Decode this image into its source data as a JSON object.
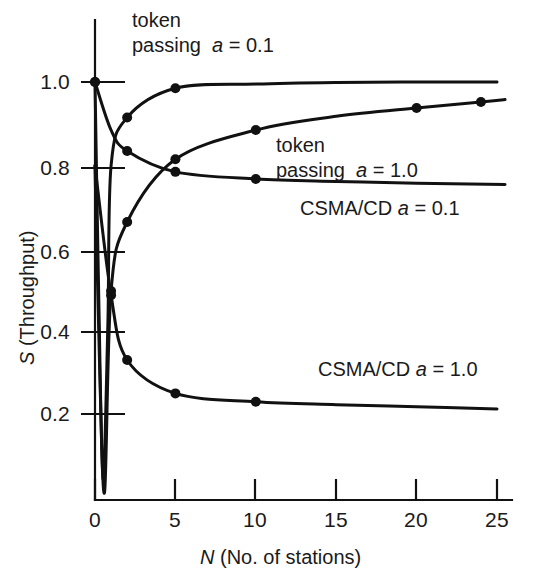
{
  "chart_data": {
    "type": "line",
    "title": "",
    "xlabel": "N (No. of stations)",
    "ylabel": "S (Throughput)",
    "xlim": [
      0,
      26
    ],
    "ylim": [
      0,
      1.06
    ],
    "grid": false,
    "legend_position": "inline-annotations",
    "xticks": [
      0,
      5,
      10,
      15,
      20,
      25
    ],
    "xtick_labels": [
      "0",
      "5",
      "10",
      "15",
      "20",
      "25"
    ],
    "yticks": [
      0.2,
      0.4,
      0.6,
      0.8,
      1.0
    ],
    "ytick_labels": [
      "0.2",
      "0.4",
      "0.6",
      "0.8",
      "1.0"
    ],
    "series": [
      {
        "name": "token passing a = 0.1",
        "label_html": "token<br>passing &nbsp;<i>a</i> = 0.1",
        "x": [
          0.0,
          0.25,
          0.5,
          0.8,
          1.0,
          2.0,
          5.0,
          10.0,
          15.0,
          20.0,
          25.0
        ],
        "y": [
          1.0,
          0.45,
          0.05,
          0.42,
          0.8,
          0.915,
          0.985,
          0.995,
          0.999,
          1.0,
          1.0
        ],
        "markers_x": [
          0,
          2,
          5
        ],
        "markers_y": [
          1.0,
          0.915,
          0.985
        ]
      },
      {
        "name": "token passing a = 1.0",
        "label_html": "token<br>passing &nbsp;<i>a</i> = 1.0",
        "x": [
          0.0,
          0.3,
          0.6,
          1.0,
          2.0,
          5.0,
          10.0,
          15.0,
          20.0,
          24.0,
          25.5
        ],
        "y": [
          0.8,
          0.3,
          0.02,
          0.5,
          0.665,
          0.815,
          0.885,
          0.918,
          0.938,
          0.952,
          0.958
        ],
        "markers_x": [
          1.0,
          2.0,
          5.0,
          10.0,
          20.0,
          24.0
        ],
        "markers_y": [
          0.5,
          0.665,
          0.815,
          0.885,
          0.938,
          0.952
        ]
      },
      {
        "name": "CSMA/CD a = 0.1",
        "label_html": "CSMA/CD <i>a</i> = 0.1",
        "x": [
          0.0,
          1.0,
          2.0,
          5.0,
          10.0,
          15.0,
          20.0,
          25.5
        ],
        "y": [
          1.0,
          0.885,
          0.835,
          0.785,
          0.768,
          0.762,
          0.758,
          0.755
        ],
        "markers_x": [
          0.0,
          2.0,
          5.0,
          10.0
        ],
        "markers_y": [
          1.0,
          0.835,
          0.785,
          0.768
        ]
      },
      {
        "name": "CSMA/CD a = 1.0",
        "label_html": "CSMA/CD <i>a</i> = 1.0",
        "x": [
          0.0,
          1.0,
          2.0,
          5.0,
          10.0,
          15.0,
          20.0,
          25.0
        ],
        "y": [
          0.8,
          0.49,
          0.335,
          0.255,
          0.235,
          0.228,
          0.223,
          0.218
        ],
        "markers_x": [
          1.0,
          2.0,
          5.0,
          10.0
        ],
        "markers_y": [
          0.49,
          0.335,
          0.255,
          0.235
        ]
      }
    ],
    "annotations": [
      {
        "id": "token-a01",
        "text": "token passing  a = 0.1"
      },
      {
        "id": "token-a10",
        "text": "token passing  a = 1.0"
      },
      {
        "id": "csma-a01",
        "text": "CSMA/CD a = 0.1"
      },
      {
        "id": "csma-a10",
        "text": "CSMA/CD a = 1.0"
      }
    ]
  },
  "colors": {
    "ink": "#111111",
    "background": "#ffffff"
  }
}
